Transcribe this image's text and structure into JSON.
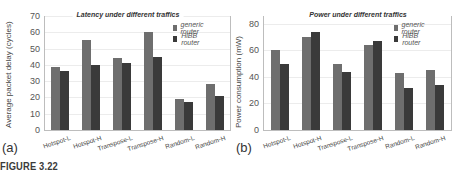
{
  "chart_data": [
    {
      "type": "bar",
      "panel": "(a)",
      "title": "Latency under different traffics",
      "xlabel": "",
      "ylabel": "Average packet delay (cycles)",
      "ylim": [
        0,
        70
      ],
      "yticks": [
        0,
        10,
        20,
        30,
        40,
        50,
        60,
        70
      ],
      "grid": true,
      "legend_position": "upper right",
      "categories": [
        "Hotspot-L",
        "Hotspot-H",
        "Transpose-L",
        "Transpose-H",
        "Random-L",
        "Random-H"
      ],
      "series": [
        {
          "name": "generic router",
          "color": "#6e6e6e",
          "values": [
            39,
            55,
            44,
            60,
            19,
            28
          ]
        },
        {
          "name": "HiBB router",
          "color": "#3a3a3a",
          "values": [
            36,
            40,
            41,
            45,
            17,
            21
          ]
        }
      ]
    },
    {
      "type": "bar",
      "panel": "(b)",
      "title": "Power under different traffics",
      "xlabel": "",
      "ylabel": "Power consumption (mW)",
      "ylim": [
        0,
        86
      ],
      "yticks": [
        0,
        20,
        40,
        60,
        80
      ],
      "grid": true,
      "legend_position": "upper right",
      "categories": [
        "Hotspot-L",
        "Hotspot-H",
        "Transpose-L",
        "Transpose-H",
        "Random-L",
        "Random-H"
      ],
      "series": [
        {
          "name": "generic router",
          "color": "#6e6e6e",
          "values": [
            60,
            70,
            50,
            64,
            43,
            45
          ]
        },
        {
          "name": "HiBB router",
          "color": "#3a3a3a",
          "values": [
            50,
            74,
            44,
            67,
            32,
            34
          ]
        }
      ]
    }
  ],
  "caption": "FIGURE 3.22"
}
